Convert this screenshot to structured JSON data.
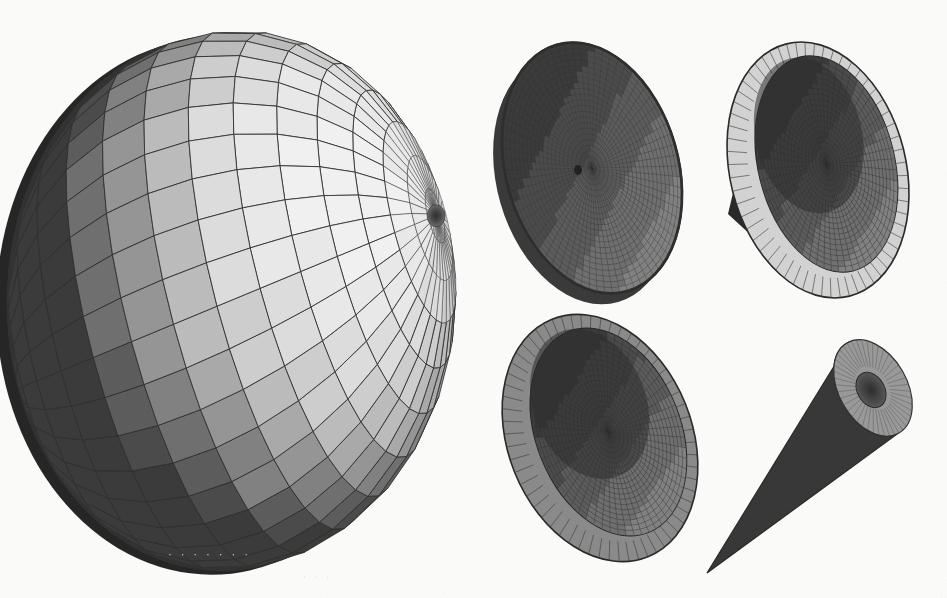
{
  "figure": {
    "domain": "scanned-technical-figure",
    "title": "",
    "caption": "",
    "background_color": "#fcfcfb",
    "ink_color": "#3a3a3a",
    "width": 947,
    "height": 598,
    "style": "flat-shaded quadrilateral mesh, grayscale, halftone scan grain",
    "bleed_through_text_a": "· · · · · · ·",
    "bleed_through_text_b": "· · ·"
  },
  "palette": {
    "band_levels": [
      "#2b2b2b",
      "#3a3a3a",
      "#4c4c4c",
      "#5d5d5d",
      "#6f6f6f",
      "#828282",
      "#969696",
      "#aaaaaa",
      "#bdbdbd",
      "#cfcfcf",
      "#dedede",
      "#eaeaea",
      "#f2f2f2"
    ],
    "wire_color": "#2f2f2f",
    "rim_dark": "#262626",
    "rim_mid": "#6a6a6a",
    "rim_light": "#d2d2d2",
    "interior_dark": "#454545",
    "interior_mid": "#5a5a5a",
    "highlight": "#f4f4f4",
    "shadow": "#232323"
  },
  "objects": [
    {
      "id": "ellipsoid-large",
      "name": "Large shaded ellipsoid with latitude-longitude quad mesh",
      "kind": "ellipsoid",
      "center_x": 232,
      "center_y": 300,
      "radius_x": 215,
      "radius_y": 268,
      "pole_x": 425,
      "pole_y": 220,
      "meridians": 36,
      "parallels": 16,
      "light_azimuth_deg": 28,
      "light_elevation_deg": 34,
      "shading": "banded-flat",
      "rim_thickness": 26,
      "shell": true
    },
    {
      "id": "cone-shallow-top",
      "name": "Shallow dark cone seen from convex side with central apex dimple",
      "kind": "cone-convex",
      "center_x": 592,
      "center_y": 168,
      "radius_x": 86,
      "radius_y": 128,
      "tilt_deg": -16,
      "apex_x": 578,
      "apex_y": 170,
      "meridians": 72,
      "parallels": 22,
      "base_tone": "#4f4f4f",
      "rim_tone": "#2e2e2e"
    },
    {
      "id": "cone-bowl-topright",
      "name": "Hollow cone seen into the open mouth with light outer rim band",
      "kind": "cone-concave",
      "center_x": 818,
      "center_y": 170,
      "radius_x": 88,
      "radius_y": 130,
      "tilt_deg": -14,
      "apex_x": 728,
      "apex_y": 214,
      "rim_band_width": 20,
      "meridians": 60,
      "parallels": 20,
      "rim_tone": "#d4d4d4",
      "interior_tone": "#4a4a4a",
      "outer_tone": "#2b2b2b"
    },
    {
      "id": "cone-bowl-bottom",
      "name": "Hollow cone bowl with mid-gray rim and dark meshed interior",
      "kind": "cone-concave",
      "center_x": 600,
      "center_y": 438,
      "radius_x": 92,
      "radius_y": 128,
      "tilt_deg": -22,
      "apex_x": 590,
      "apex_y": 470,
      "rim_band_width": 20,
      "meridians": 60,
      "parallels": 20,
      "rim_tone": "#8b8b8b",
      "interior_tone": "#4b4b4b",
      "outer_tone": "#343434"
    },
    {
      "id": "cone-sharp-bottomright",
      "name": "Slender solid cone tapering to a point at lower left",
      "kind": "cone-solid",
      "apex_x": 707,
      "apex_y": 573,
      "base_x": 873,
      "base_y": 388,
      "base_radius_x": 34,
      "base_radius_y": 52,
      "base_tilt_deg": -30,
      "body_tone": "#373737",
      "cap_tone": "#9a9a9a",
      "hole_tone": "#3d3d3d"
    }
  ],
  "legend": [],
  "annotations": []
}
